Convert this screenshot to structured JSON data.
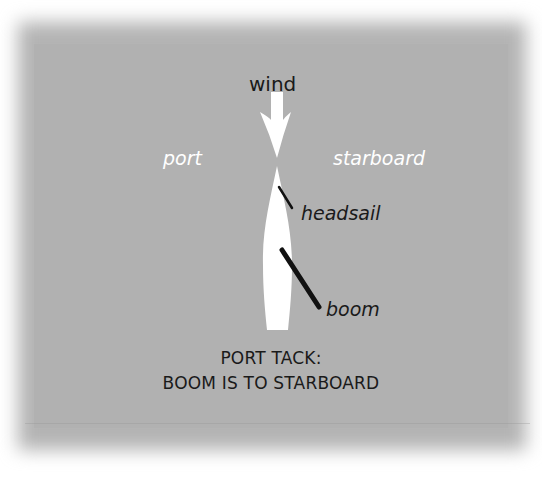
{
  "diagram": {
    "labels": {
      "wind": "wind",
      "port": "port",
      "starboard": "starboard",
      "headsail": "headsail",
      "boom": "boom"
    },
    "caption": {
      "line1": "PORT TACK:",
      "line2": "BOOM IS TO STARBOARD"
    },
    "colors": {
      "background": "#b1b1b1",
      "boat": "#ffffff",
      "wind_arrow": "#ffffff",
      "spars": "#111111",
      "dark_text": "#1a1a1a",
      "light_text": "#ffffff"
    }
  }
}
